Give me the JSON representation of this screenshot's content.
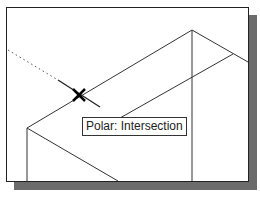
{
  "viewport": {
    "tooltip": {
      "text": "Polar: Intersection"
    },
    "snap_marker": {
      "icon": "intersection-x-icon",
      "x": 79,
      "y": 95
    },
    "colors": {
      "line": "#333333",
      "shadow": "#6b6b6b",
      "background": "#ffffff"
    }
  }
}
